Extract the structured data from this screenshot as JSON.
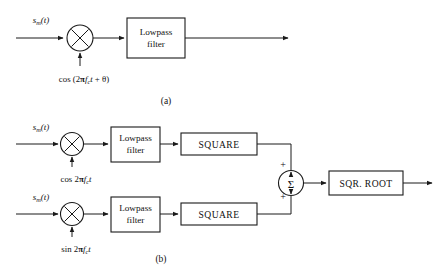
{
  "figure": {
    "background": "#ffffff",
    "ink": "#1a1a1a"
  },
  "panel_a": {
    "caption": "(a)",
    "input_label": {
      "base": "s",
      "sub": "m",
      "arg": "(t)"
    },
    "mixer": {
      "name": "multiplier",
      "glyph": "x"
    },
    "oscillator_label": {
      "prefix": "cos (2",
      "pi": "π",
      "freq": "f",
      "freq_sub": "c",
      "time": "t",
      "plus_theta": " + θ)",
      "full": "cos (2πf_c t + θ)"
    },
    "filter_box": {
      "line1": "Lowpass",
      "line2": "filter"
    }
  },
  "panel_b": {
    "caption": "(b)",
    "branches": [
      {
        "id": "in-phase",
        "input_label": {
          "base": "s",
          "sub": "m",
          "arg": "(t)"
        },
        "mixer": {
          "name": "multiplier",
          "glyph": "x"
        },
        "oscillator_label": {
          "prefix": "cos 2",
          "pi": "π",
          "freq": "f",
          "freq_sub": "c",
          "time": "t",
          "full": "cos 2πf_c t"
        },
        "filter_box": {
          "line1": "Lowpass",
          "line2": "filter"
        },
        "square_box": {
          "label": "SQUARE"
        },
        "sum_sign": "+"
      },
      {
        "id": "quadrature",
        "input_label": {
          "base": "s",
          "sub": "m",
          "arg": "(t)"
        },
        "mixer": {
          "name": "multiplier",
          "glyph": "x"
        },
        "oscillator_label": {
          "prefix": "sin 2",
          "pi": "π",
          "freq": "f",
          "freq_sub": "c",
          "time": "t",
          "full": "sin 2πf_c t"
        },
        "filter_box": {
          "line1": "Lowpass",
          "line2": "filter"
        },
        "square_box": {
          "label": "SQUARE"
        },
        "sum_sign": "+"
      }
    ],
    "summer": {
      "glyph": "Σ",
      "name": "summing-junction"
    },
    "sqrt_box": {
      "label": "SQR. ROOT"
    }
  }
}
